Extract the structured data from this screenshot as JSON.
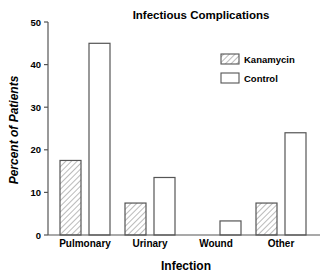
{
  "chart_data": {
    "type": "bar",
    "title": "Infectious Complications",
    "xlabel": "Infection",
    "ylabel": "Percent of Patients",
    "categories": [
      "Pulmonary",
      "Urinary",
      "Wound",
      "Other"
    ],
    "series": [
      {
        "name": "Kanamycin",
        "pattern": "hatched",
        "values": [
          17.5,
          7.5,
          0,
          7.5
        ]
      },
      {
        "name": "Control",
        "pattern": "open",
        "values": [
          45,
          13.5,
          3.3,
          24
        ]
      }
    ],
    "ylim": [
      0,
      50
    ],
    "yticks": [
      0,
      10,
      20,
      30,
      40,
      50
    ],
    "grid": false,
    "legend_position": "upper right"
  },
  "colors": {
    "ink": "#555555",
    "text": "#1a1a1a",
    "background": "#ffffff"
  }
}
